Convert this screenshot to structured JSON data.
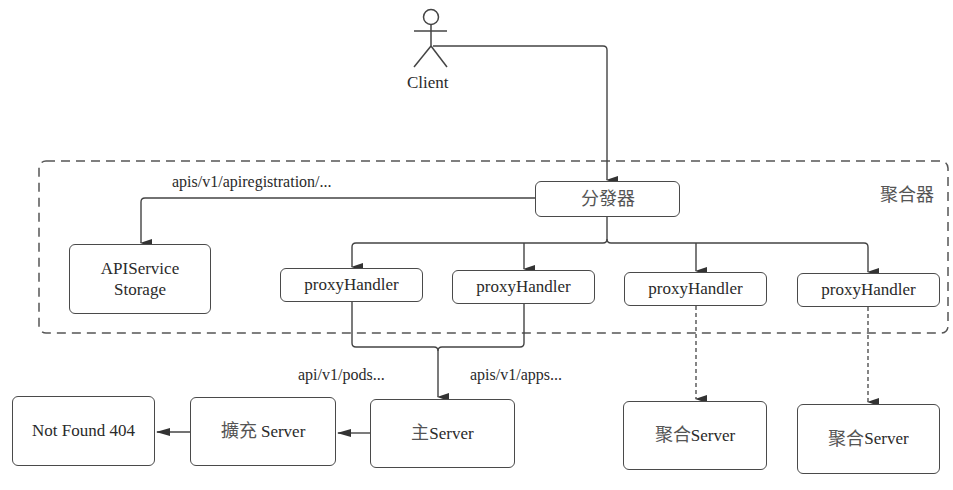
{
  "diagram": {
    "client": {
      "label": "Client",
      "icon": "stick-figure-actor"
    },
    "aggregator": {
      "label": "聚合器",
      "dispatcher": "分發器",
      "apiservice_storage": {
        "line1": "APIService",
        "line2": "Storage"
      },
      "proxy_handlers": [
        "proxyHandler",
        "proxyHandler",
        "proxyHandler",
        "proxyHandler"
      ]
    },
    "edge_labels": {
      "apiregistration": "apis/v1/apiregistration/...",
      "pods": "api/v1/pods...",
      "apps": "apis/v1/apps..."
    },
    "servers": {
      "main": {
        "prefix": "主",
        "name": "Server"
      },
      "extension": {
        "prefix": "擴充",
        "name": " Server"
      },
      "not_found": "Not Found 404",
      "aggregated": [
        {
          "prefix": "聚合",
          "name": "Server"
        },
        {
          "prefix": "聚合",
          "name": "Server"
        }
      ]
    },
    "colors": {
      "stroke": "#4a4a4a",
      "text": "#2a2a2a",
      "background": "#ffffff"
    }
  }
}
